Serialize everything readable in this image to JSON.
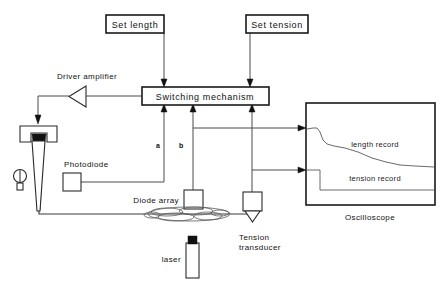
{
  "diagram": {
    "blocks": {
      "set_length": "Set length",
      "set_tension": "Set tension",
      "switching_mechanism": "Switching  mechanism",
      "driver_amplifier": "Driver  amplifier",
      "photodiode": "Photodiode",
      "diode_array": "Diode  array",
      "tension_transducer_line1": "Tension",
      "tension_transducer_line2": "transducer",
      "laser": "laser",
      "oscilloscope": "Oscilloscope"
    },
    "node_labels": {
      "a": "a",
      "b": "b"
    },
    "oscilloscope_traces": {
      "length_record": "length  record",
      "tension_record": "tension  record"
    },
    "colors": {
      "background": "#ffffff",
      "frame_stroke": "#1a1a1a",
      "wire_stroke": "#4a4a4a",
      "trace_stroke": "#6a6a6a",
      "text": "#111111",
      "solid_fill": "#111111"
    }
  }
}
